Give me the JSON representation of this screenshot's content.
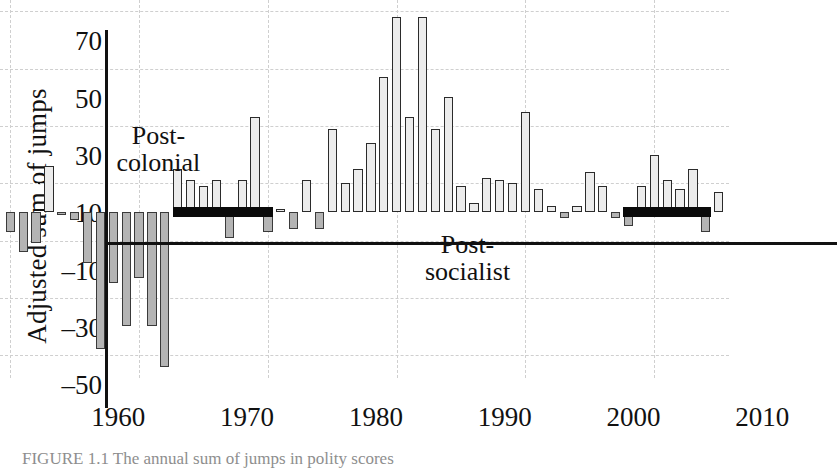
{
  "chart_data": {
    "type": "bar",
    "title": "",
    "xlabel": "",
    "ylabel": "Adjusted sum of jumps",
    "xlim": [
      1959.2,
      2015.8
    ],
    "ylim": [
      -58,
      74
    ],
    "grid": true,
    "legend": false,
    "y_ticks": [
      70,
      50,
      30,
      10,
      -10,
      -30,
      -50
    ],
    "y_tick_labels": [
      "70",
      "50",
      "30",
      "10",
      "–10",
      "–30",
      "–50"
    ],
    "x_ticks": [
      1960,
      1970,
      1980,
      1990,
      2000,
      2010
    ],
    "x_tick_labels": [
      "1960",
      "1970",
      "1980",
      "1990",
      "2000",
      "2010"
    ],
    "bar_colors": {
      "positive": "#ececec",
      "negative": "#b4b4b4",
      "edge": "#2b2b2b",
      "period": "#0a0a0a"
    },
    "x": [
      1960,
      1961,
      1962,
      1963,
      1964,
      1965,
      1966,
      1967,
      1968,
      1969,
      1970,
      1971,
      1972,
      1973,
      1974,
      1975,
      1976,
      1977,
      1978,
      1979,
      1980,
      1981,
      1982,
      1983,
      1984,
      1985,
      1986,
      1987,
      1988,
      1989,
      1990,
      1991,
      1992,
      1993,
      1994,
      1995,
      1996,
      1997,
      1998,
      1999,
      2000,
      2001,
      2002,
      2003,
      2004,
      2005,
      2006,
      2007,
      2008,
      2009,
      2010,
      2011,
      2012,
      2013,
      2014,
      2015
    ],
    "values": [
      -7,
      -14,
      -11,
      16,
      -1,
      -3,
      -18,
      -48,
      -25,
      -40,
      -23,
      -40,
      -54,
      15,
      11,
      9,
      11,
      -9,
      11,
      33,
      -7,
      1,
      -6,
      11,
      -6,
      29,
      10,
      15,
      24,
      47,
      68,
      33,
      68,
      29,
      40,
      9,
      3,
      12,
      11,
      10,
      35,
      8,
      2,
      -2,
      2,
      14,
      9,
      -2,
      -5,
      9,
      20,
      11,
      8,
      15,
      -7,
      7
    ],
    "annotations": [
      {
        "text": "Post-colonial",
        "lines": [
          "Post-",
          "colonial"
        ],
        "x": 1971.5,
        "y": 24
      },
      {
        "text": "Post-socialist",
        "lines": [
          "Post-",
          "socialist"
        ],
        "x": 1995.5,
        "y": -14
      }
    ],
    "period_bars": [
      {
        "name": "post-colonial-period",
        "x_start": 1972.6,
        "x_end": 1980.4,
        "y": 0
      },
      {
        "name": "post-socialist-period",
        "x_start": 2007.6,
        "x_end": 2014.4,
        "y": 0
      }
    ]
  },
  "caption": {
    "text": "FIGURE 1.1   The annual sum of jumps in polity scores"
  }
}
